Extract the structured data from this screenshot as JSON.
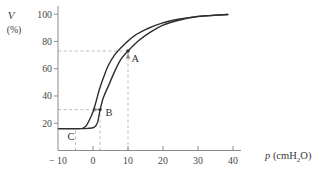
{
  "chart_data": {
    "type": "line",
    "title": "",
    "xlabel": {
      "symbol": "p",
      "unit_pre": " (cmH",
      "unit_sub": "2",
      "unit_post": "O)"
    },
    "ylabel": {
      "symbol": "V",
      "unit": "(%)"
    },
    "xlim": [
      -10,
      42
    ],
    "ylim": [
      0,
      106
    ],
    "grid": false,
    "legend": null,
    "x_ticks": [
      {
        "value": -10,
        "label": "− 10",
        "tick_mark": false
      },
      {
        "value": 0,
        "label": "0",
        "tick_mark": true
      },
      {
        "value": 10,
        "label": "10",
        "tick_mark": true
      },
      {
        "value": 20,
        "label": "20",
        "tick_mark": true
      },
      {
        "value": 30,
        "label": "30",
        "tick_mark": true
      },
      {
        "value": 40,
        "label": "40",
        "tick_mark": true
      }
    ],
    "y_ticks": [
      {
        "value": 20,
        "label": "20"
      },
      {
        "value": 40,
        "label": "40"
      },
      {
        "value": 60,
        "label": "60"
      },
      {
        "value": 80,
        "label": "80"
      },
      {
        "value": 100,
        "label": "100"
      }
    ],
    "series": [
      {
        "name": "inspiration-limb",
        "points": [
          [
            -10,
            16
          ],
          [
            -4,
            16
          ],
          [
            -1.5,
            16.2
          ],
          [
            0.3,
            17
          ],
          [
            1.3,
            20.5
          ],
          [
            2,
            29.5
          ],
          [
            3,
            39
          ],
          [
            4.5,
            48
          ],
          [
            6.2,
            58
          ],
          [
            8,
            67
          ],
          [
            10,
            73
          ],
          [
            13,
            80.5
          ],
          [
            16.5,
            87
          ],
          [
            20,
            92
          ],
          [
            24.5,
            95.6
          ],
          [
            28.5,
            97.8
          ],
          [
            33,
            99
          ],
          [
            38.5,
            99.8
          ]
        ]
      },
      {
        "name": "expiration-limb",
        "points": [
          [
            -3,
            16.2
          ],
          [
            -2,
            18
          ],
          [
            -1,
            22.5
          ],
          [
            0,
            28.5
          ],
          [
            1,
            37
          ],
          [
            1.8,
            44.5
          ],
          [
            3,
            53.5
          ],
          [
            4.3,
            62
          ],
          [
            6.3,
            70.5
          ],
          [
            9,
            78
          ],
          [
            12,
            84.5
          ],
          [
            15.7,
            89.5
          ],
          [
            19.7,
            93.5
          ],
          [
            24.3,
            96.3
          ],
          [
            29,
            98
          ],
          [
            33.5,
            99
          ],
          [
            38.5,
            99.8
          ]
        ]
      }
    ],
    "marked_points": [
      {
        "label": "A",
        "p": 10,
        "v": 73,
        "dot": true
      },
      {
        "label": "B",
        "p": 2,
        "v": 30,
        "dot": true
      },
      {
        "label": "C",
        "p": -5,
        "v": 16,
        "dot": false
      }
    ],
    "guides": [
      {
        "type": "h",
        "v": 73,
        "from_p": -10,
        "to_p": 10,
        "arrow": null
      },
      {
        "type": "v",
        "p": 10,
        "from_v": 0,
        "to_v": 73,
        "arrow": "up"
      },
      {
        "type": "h",
        "v": 30,
        "from_p": -10,
        "to_p": 2,
        "arrow": "right"
      },
      {
        "type": "v",
        "p": 2,
        "from_v": 0,
        "to_v": 30,
        "arrow": null
      },
      {
        "type": "v",
        "p": -5,
        "from_v": 0,
        "to_v": 16,
        "arrow": null
      }
    ],
    "colors": {
      "curve": "#2e2e2e",
      "axis": "#8c8c8c",
      "dashed": "#bdbdbd",
      "text": "#454545",
      "point": "#333333"
    }
  }
}
